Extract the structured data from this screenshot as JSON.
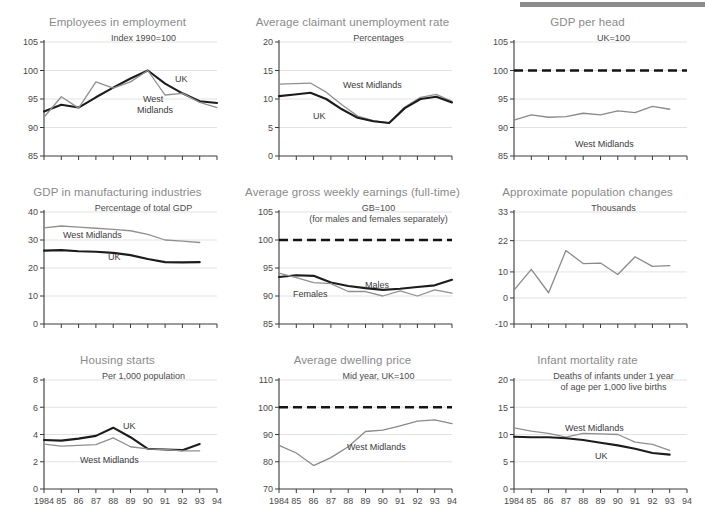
{
  "page": {
    "axis_years": [
      "1984",
      "85",
      "86",
      "87",
      "88",
      "89",
      "90",
      "91",
      "92",
      "93",
      "94"
    ],
    "accent_uk": "#1c1c1c",
    "accent_wm": "#909090",
    "grid_color": "#e2e2e2",
    "title_color": "#8a8a8a",
    "topbar_color": "#8c8c8c"
  },
  "chart_data": [
    {
      "id": "employees-in-employment",
      "type": "line",
      "title": "Employees in employment",
      "subtitle": "Index 1990=100",
      "xlabel": "",
      "ylabel": "",
      "ylim": [
        85,
        105
      ],
      "yticks": [
        85,
        90,
        95,
        100,
        105
      ],
      "grid": true,
      "x": [
        "1984",
        "85",
        "86",
        "87",
        "88",
        "89",
        "90",
        "91",
        "92",
        "93",
        "94"
      ],
      "series": [
        {
          "name": "UK",
          "values": [
            92.8,
            94.0,
            93.5,
            95.3,
            97.0,
            98.6,
            100.0,
            97.7,
            96.0,
            94.6,
            94.3
          ],
          "label_at": "UK"
        },
        {
          "name": "West Midlands",
          "values": [
            91.8,
            95.4,
            93.4,
            98.0,
            96.9,
            98.0,
            100.0,
            95.7,
            96.0,
            94.4,
            93.5
          ],
          "label_at": "West Midlands"
        }
      ]
    },
    {
      "id": "average-claimant-unemployment-rate",
      "type": "line",
      "title": "Average claimant unemployment rate",
      "subtitle": "Percentages",
      "ylim": [
        0,
        20
      ],
      "yticks": [
        0,
        5,
        10,
        15,
        20
      ],
      "grid": true,
      "x": [
        "1984",
        "85",
        "86",
        "87",
        "88",
        "89",
        "90",
        "91",
        "92",
        "93",
        "94"
      ],
      "series": [
        {
          "name": "West Midlands",
          "values": [
            12.6,
            12.7,
            12.8,
            11.2,
            9.0,
            7.0,
            6.2,
            5.8,
            8.6,
            10.3,
            10.8,
            9.6
          ],
          "label_at": "West Midlands"
        },
        {
          "name": "UK",
          "values": [
            10.5,
            10.8,
            11.1,
            10.0,
            8.2,
            6.7,
            6.1,
            5.8,
            8.4,
            10.0,
            10.4,
            9.4
          ],
          "label_at": "UK"
        }
      ]
    },
    {
      "id": "gdp-per-head",
      "type": "line",
      "title": "GDP per head",
      "subtitle": "UK=100",
      "ylim": [
        85,
        105
      ],
      "yticks": [
        85,
        90,
        95,
        100,
        105
      ],
      "grid": true,
      "reference_line": {
        "value": 100,
        "style": "dashed",
        "label": ""
      },
      "x": [
        "1984",
        "85",
        "86",
        "87",
        "88",
        "89",
        "90",
        "91",
        "92",
        "93",
        "94"
      ],
      "series": [
        {
          "name": "West Midlands",
          "values": [
            91.3,
            92.2,
            91.8,
            91.9,
            92.5,
            92.2,
            92.9,
            92.6,
            93.7,
            93.2
          ],
          "label_at": "West Midlands"
        }
      ]
    },
    {
      "id": "gdp-in-manufacturing-industries",
      "type": "line",
      "title": "GDP in manufacturing industries",
      "subtitle": "Percentage of total GDP",
      "ylim": [
        0,
        40
      ],
      "yticks": [
        0,
        10,
        20,
        30,
        40
      ],
      "grid": true,
      "x": [
        "1984",
        "85",
        "86",
        "87",
        "88",
        "89",
        "90",
        "91",
        "92",
        "93",
        "94"
      ],
      "series": [
        {
          "name": "West Midlands",
          "values": [
            34.3,
            35.0,
            34.6,
            34.2,
            33.8,
            33.3,
            32.0,
            30.0,
            29.6,
            29.1
          ],
          "label_at": "West Midlands"
        },
        {
          "name": "UK",
          "values": [
            26.2,
            26.4,
            26.0,
            25.8,
            25.4,
            24.6,
            23.2,
            22.1,
            22.0,
            22.1
          ],
          "label_at": "UK"
        }
      ]
    },
    {
      "id": "average-gross-weekly-earnings",
      "type": "line",
      "title": "Average gross weekly earnings (full-time)",
      "subtitle": "GB=100",
      "subtitle2": "(for males and females separately)",
      "ylim": [
        85,
        105
      ],
      "yticks": [
        85,
        90,
        95,
        100,
        105
      ],
      "grid": true,
      "reference_line": {
        "value": 100,
        "style": "dashed",
        "label": ""
      },
      "x": [
        "1984",
        "85",
        "86",
        "87",
        "88",
        "89",
        "90",
        "91",
        "92",
        "93",
        "94"
      ],
      "series": [
        {
          "name": "Males",
          "values": [
            93.4,
            93.7,
            93.6,
            92.4,
            91.8,
            91.4,
            91.1,
            91.3,
            91.6,
            91.9,
            92.9
          ],
          "label_at": "Males"
        },
        {
          "name": "Females",
          "values": [
            94.1,
            93.3,
            92.4,
            92.2,
            90.8,
            90.8,
            90.0,
            90.9,
            90.0,
            91.1,
            90.5
          ],
          "label_at": "Females"
        }
      ]
    },
    {
      "id": "approximate-population-changes",
      "type": "line",
      "title": "Approximate population changes",
      "subtitle": "Thousands",
      "ylim": [
        -10,
        33
      ],
      "yticks": [
        -10,
        0,
        10,
        22,
        33
      ],
      "grid": true,
      "x": [
        "1984",
        "85",
        "86",
        "87",
        "88",
        "89",
        "90",
        "91",
        "92",
        "93",
        "94"
      ],
      "series": [
        {
          "name": "Population change",
          "values": [
            3.0,
            11.0,
            2.0,
            18.2,
            13.2,
            13.4,
            9.0,
            15.8,
            12.1,
            12.4
          ],
          "label_at": ""
        }
      ]
    },
    {
      "id": "housing-starts",
      "type": "line",
      "title": "Housing starts",
      "subtitle": "Per 1,000 population",
      "ylim": [
        0,
        8
      ],
      "yticks": [
        0,
        2,
        4,
        6,
        8
      ],
      "grid": true,
      "x": [
        "1984",
        "85",
        "86",
        "87",
        "88",
        "89",
        "90",
        "91",
        "92",
        "93",
        "94"
      ],
      "series": [
        {
          "name": "UK",
          "values": [
            3.6,
            3.55,
            3.7,
            3.9,
            4.5,
            3.8,
            2.95,
            2.9,
            2.85,
            3.3
          ],
          "label_at": "UK"
        },
        {
          "name": "West Midlands",
          "values": [
            3.3,
            3.15,
            3.2,
            3.25,
            3.75,
            3.1,
            2.95,
            2.9,
            2.8,
            2.8
          ],
          "label_at": "West Midlands"
        }
      ]
    },
    {
      "id": "average-dwelling-price",
      "type": "line",
      "title": "Average dwelling price",
      "subtitle": "Mid year, UK=100",
      "ylim": [
        70,
        110
      ],
      "yticks": [
        70,
        80,
        90,
        100,
        110
      ],
      "grid": true,
      "reference_line": {
        "value": 100,
        "style": "dashed",
        "label": ""
      },
      "x": [
        "1984",
        "85",
        "86",
        "87",
        "88",
        "89",
        "90",
        "91",
        "92",
        "93",
        "94"
      ],
      "series": [
        {
          "name": "West Midlands",
          "values": [
            86.0,
            83.2,
            78.6,
            81.5,
            85.5,
            91.1,
            91.6,
            93.2,
            94.9,
            95.4,
            94.0
          ],
          "label_at": "West Midlands"
        }
      ]
    },
    {
      "id": "infant-mortality-rate",
      "type": "line",
      "title": "Infant mortality rate",
      "subtitle": "Deaths of infants under 1 year",
      "subtitle2": "of age per 1,000 live births",
      "ylim": [
        0,
        20
      ],
      "yticks": [
        0,
        5,
        10,
        15,
        20
      ],
      "grid": true,
      "x": [
        "1984",
        "85",
        "86",
        "87",
        "88",
        "89",
        "90",
        "91",
        "92",
        "93",
        "94"
      ],
      "series": [
        {
          "name": "West Midlands",
          "values": [
            11.2,
            10.6,
            10.2,
            9.5,
            10.2,
            10.1,
            10.0,
            8.6,
            8.2,
            7.1
          ],
          "label_at": "West Midlands"
        },
        {
          "name": "UK",
          "values": [
            9.6,
            9.5,
            9.5,
            9.3,
            9.0,
            8.5,
            8.0,
            7.4,
            6.6,
            6.3
          ],
          "label_at": "UK"
        }
      ]
    }
  ]
}
